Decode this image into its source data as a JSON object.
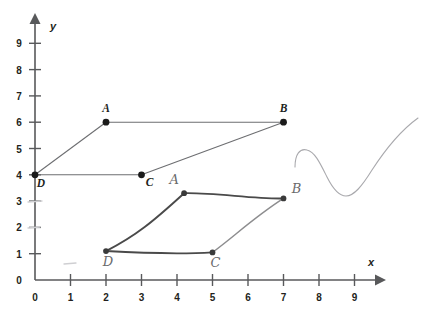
{
  "figure": {
    "axes": {
      "x_label": "x",
      "y_label": "y",
      "x_ticks": [
        "0",
        "1",
        "2",
        "3",
        "4",
        "5",
        "6",
        "7",
        "8",
        "9"
      ],
      "y_ticks": [
        "0",
        "1",
        "2",
        "3",
        "4",
        "5",
        "6",
        "7",
        "8",
        "9"
      ],
      "x_range": [
        0,
        9
      ],
      "y_range": [
        0,
        9
      ],
      "origin_label": "0",
      "axis_color": "#58595b"
    },
    "printed_shape": {
      "name": "parallelogram-abcd",
      "stroke_color": "#6d6e71",
      "vertices": [
        {
          "label": "A",
          "x": 2,
          "y": 6,
          "label_dx": 0,
          "label_dy": -10
        },
        {
          "label": "B",
          "x": 7,
          "y": 6,
          "label_dx": 0,
          "label_dy": -10
        },
        {
          "label": "C",
          "x": 3,
          "y": 4,
          "label_dx": 8,
          "label_dy": 11
        },
        {
          "label": "D",
          "x": 0,
          "y": 4,
          "label_dx": 6,
          "label_dy": 12
        }
      ],
      "edges": [
        [
          "A",
          "B"
        ],
        [
          "B",
          "C"
        ],
        [
          "C",
          "D"
        ],
        [
          "D",
          "A"
        ]
      ]
    },
    "hand_drawn_shape": {
      "name": "hand-drawn-parallelogram-abcd",
      "stroke_color": "#4a4a4a",
      "vertices": [
        {
          "label": "A",
          "x": 4.2,
          "y": 3.3,
          "label_dx": -10,
          "label_dy": -9
        },
        {
          "label": "B",
          "x": 7.0,
          "y": 3.1,
          "label_dx": 13,
          "label_dy": -5
        },
        {
          "label": "C",
          "x": 5.0,
          "y": 1.05,
          "label_dx": 3,
          "label_dy": 15
        },
        {
          "label": "D",
          "x": 2.0,
          "y": 1.1,
          "label_dx": 2,
          "label_dy": 15
        }
      ],
      "edges": [
        [
          "A",
          "B"
        ],
        [
          "B",
          "C"
        ],
        [
          "C",
          "D"
        ],
        [
          "D",
          "A"
        ]
      ]
    },
    "pencil_squiggle": {
      "name": "stray-pencil-curve",
      "stroke_color": "#a9a9ad"
    }
  },
  "chart_data": {
    "type": "scatter",
    "xlabel": "x",
    "ylabel": "y",
    "xlim": [
      0,
      9
    ],
    "ylim": [
      0,
      9
    ],
    "grid": false,
    "legend": "none",
    "xticks": [
      0,
      1,
      2,
      3,
      4,
      5,
      6,
      7,
      8,
      9
    ],
    "yticks": [
      0,
      1,
      2,
      3,
      4,
      5,
      6,
      7,
      8,
      9
    ],
    "series": [
      {
        "name": "Parallelogram ABCD (printed)",
        "labels": [
          "A",
          "B",
          "C",
          "D"
        ],
        "x": [
          2,
          7,
          3,
          0
        ],
        "y": [
          6,
          6,
          4,
          4
        ],
        "closed_path_order": [
          "A",
          "B",
          "C",
          "D"
        ]
      },
      {
        "name": "Parallelogram ABCD (hand-drawn)",
        "labels": [
          "A",
          "B",
          "C",
          "D"
        ],
        "x": [
          4.2,
          7.0,
          5.0,
          2.0
        ],
        "y": [
          3.3,
          3.1,
          1.05,
          1.1
        ],
        "closed_path_order": [
          "A",
          "B",
          "C",
          "D"
        ]
      }
    ]
  }
}
